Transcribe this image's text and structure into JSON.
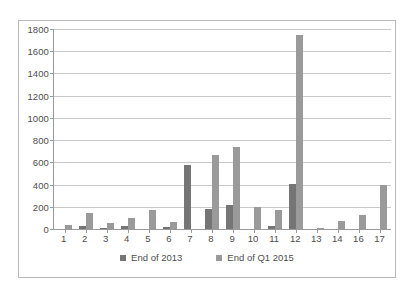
{
  "chart_data": {
    "type": "bar",
    "title": "",
    "subtitle": "",
    "xlabel": "",
    "ylabel": "",
    "ylim": [
      0,
      1800
    ],
    "ytick_step": 200,
    "yticks": [
      "1800",
      "1600",
      "1400",
      "1200",
      "1000",
      "800",
      "600",
      "400",
      "200",
      "0"
    ],
    "grid": true,
    "legend_position": "bottom",
    "categories": [
      "1",
      "2",
      "3",
      "4",
      "5",
      "6",
      "7",
      "8",
      "9",
      "10",
      "11",
      "12",
      "13",
      "14",
      "16",
      "17"
    ],
    "series": [
      {
        "name": "End of 2013",
        "color": "#757575",
        "values": [
          0,
          25,
          10,
          25,
          0,
          22,
          575,
          180,
          215,
          0,
          30,
          405,
          0,
          0,
          0,
          0
        ]
      },
      {
        "name": "End of Q1 2015",
        "color": "#9a9a9a",
        "values": [
          40,
          145,
          55,
          95,
          170,
          60,
          0,
          670,
          735,
          200,
          170,
          1745,
          10,
          70,
          130,
          395
        ]
      }
    ]
  },
  "legend": {
    "items": [
      {
        "label": "End of 2013"
      },
      {
        "label": "End of Q1 2015"
      }
    ]
  }
}
